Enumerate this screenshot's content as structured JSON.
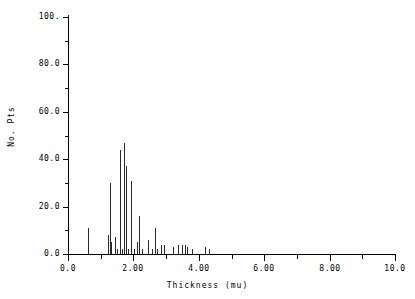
{
  "figure": {
    "background_color": "#ffffff",
    "ink_color": "#000000"
  },
  "axes": {
    "y": {
      "title": "No. Pts",
      "tick_labels": [
        "0.0",
        "20.0",
        "40.0",
        "60.0",
        "80.0",
        "100."
      ],
      "tick_values": [
        0,
        20,
        40,
        60,
        80,
        100
      ],
      "minor_tick_values": [
        10,
        30,
        50,
        70,
        90
      ],
      "range": [
        0,
        100
      ]
    },
    "x": {
      "title": "Thickness (mu)",
      "tick_labels": [
        "0.0",
        "2.00",
        "4.00",
        "6.00",
        "8.00",
        "10.0"
      ],
      "tick_values": [
        0,
        2,
        4,
        6,
        8,
        10
      ],
      "minor_tick_values": [
        1,
        3,
        5,
        7,
        9
      ],
      "range": [
        0,
        10
      ]
    }
  },
  "chart_data": {
    "type": "bar",
    "title": "",
    "subtitle": "",
    "xlabel": "Thickness (mu)",
    "ylabel": "No. Pts",
    "xlim": [
      0,
      10
    ],
    "ylim": [
      0,
      100
    ],
    "grid": false,
    "legend": null,
    "series_color": "#2a2a2a",
    "x": [
      0.62,
      1.22,
      1.28,
      1.33,
      1.43,
      1.5,
      1.6,
      1.65,
      1.72,
      1.78,
      1.85,
      1.93,
      2.02,
      2.1,
      2.17,
      2.25,
      2.45,
      2.57,
      2.65,
      2.72,
      2.85,
      2.95,
      3.22,
      3.35,
      3.48,
      3.58,
      3.65,
      3.78,
      4.18,
      4.32
    ],
    "values": [
      11,
      8,
      30,
      5,
      7,
      2,
      44,
      2,
      47,
      37,
      2,
      31,
      2,
      5,
      16,
      2,
      6,
      2,
      11,
      2,
      4,
      4,
      3,
      4,
      4,
      4,
      3,
      2,
      3,
      2
    ]
  }
}
